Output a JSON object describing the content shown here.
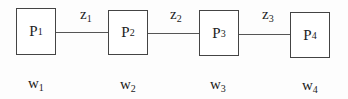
{
  "nodes": [
    {
      "id": "P",
      "sub": "1",
      "x": 16,
      "y": 8,
      "w": 40,
      "h": 47
    },
    {
      "id": "P",
      "sub": "2",
      "x": 108,
      "y": 10,
      "w": 40,
      "h": 45
    },
    {
      "id": "P",
      "sub": "3",
      "x": 199,
      "y": 10,
      "w": 40,
      "h": 46
    },
    {
      "id": "P",
      "sub": "4",
      "x": 290,
      "y": 12,
      "w": 40,
      "h": 46
    }
  ],
  "edges": [
    {
      "id": "z",
      "sub": "1",
      "x1": 56,
      "x2": 108,
      "y": 32,
      "lx": 80,
      "ly": 6
    },
    {
      "id": "z",
      "sub": "2",
      "x1": 148,
      "x2": 199,
      "y": 33,
      "lx": 170,
      "ly": 6
    },
    {
      "id": "z",
      "sub": "3",
      "x1": 239,
      "x2": 290,
      "y": 34,
      "lx": 262,
      "ly": 6
    }
  ],
  "weights": [
    {
      "id": "w",
      "sub": "1",
      "x": 28,
      "y": 75
    },
    {
      "id": "w",
      "sub": "2",
      "x": 120,
      "y": 76
    },
    {
      "id": "w",
      "sub": "3",
      "x": 210,
      "y": 76
    },
    {
      "id": "w",
      "sub": "4",
      "x": 302,
      "y": 77
    }
  ]
}
